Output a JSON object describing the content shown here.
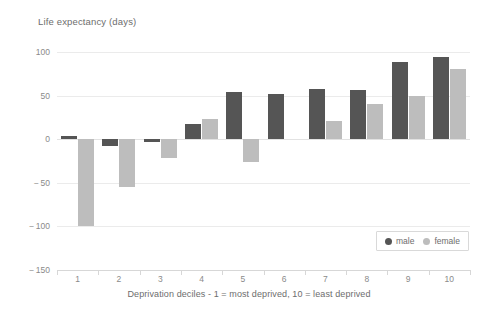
{
  "chart_data": {
    "type": "bar",
    "title": "Life expectancy (days)",
    "xlabel": "Deprivation deciles - 1 = most deprived, 10 = least deprived",
    "ylabel": "",
    "categories": [
      "1",
      "2",
      "3",
      "4",
      "5",
      "6",
      "7",
      "8",
      "9",
      "10"
    ],
    "series": [
      {
        "name": "male",
        "color": "#555555",
        "values": [
          4,
          -8,
          -3,
          17,
          54,
          52,
          57,
          56,
          89,
          94
        ]
      },
      {
        "name": "female",
        "color": "#bdbdbd",
        "values": [
          -99,
          -55,
          -22,
          23,
          -26,
          0,
          21,
          40,
          49,
          81
        ]
      }
    ],
    "ylim": [
      -150,
      100
    ],
    "yticks": [
      100,
      50,
      0,
      -50,
      -100,
      -150
    ],
    "ytick_labels": [
      "100",
      "50",
      "0",
      "− 50",
      "− 100",
      "− 150"
    ],
    "grid": true,
    "grid_axis": "y",
    "legend_position": "bottom-right",
    "background": "#ffffff",
    "grid_color": "#ebebeb",
    "axis_color": "#d7d7d7",
    "text_color": "#6d6d6d",
    "tick_text_color": "#8a8a8a"
  },
  "legend": {
    "entries": [
      {
        "label": "male"
      },
      {
        "label": "female"
      }
    ]
  }
}
